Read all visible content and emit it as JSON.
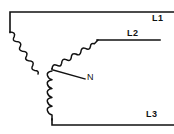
{
  "diagram": {
    "type": "star-wye-three-phase-winding-connection",
    "canvas": {
      "width": 174,
      "height": 134,
      "background": "#ffffff"
    },
    "line_color": "#111111",
    "labels": {
      "l1": "L1",
      "l2": "L2",
      "l3": "L3",
      "n": "N"
    },
    "nodes": {
      "star_point": {
        "x": 52,
        "y": 69,
        "name": "neutral-star-point"
      }
    },
    "conductors": [
      {
        "name": "l1-conductor",
        "path": "M 10 32 L 10 12 L 174 12"
      },
      {
        "name": "l2-conductor",
        "path": "M 98 40 L 160 40"
      },
      {
        "name": "l3-conductor",
        "path": "M 52 120 L 52 125 L 174 125"
      }
    ],
    "windings": [
      {
        "name": "winding-l1",
        "from": "L1",
        "to": "N",
        "turns": 9,
        "orientation": "diagonal-down-right"
      },
      {
        "name": "winding-l2",
        "from": "N",
        "to": "L2",
        "turns": 9,
        "orientation": "diagonal-up-right"
      },
      {
        "name": "winding-l3",
        "from": "N",
        "to": "L3",
        "turns": 9,
        "orientation": "vertical-down"
      }
    ],
    "leader": {
      "name": "neutral-leader-line",
      "path": "M 53 70 L 85 79"
    }
  }
}
